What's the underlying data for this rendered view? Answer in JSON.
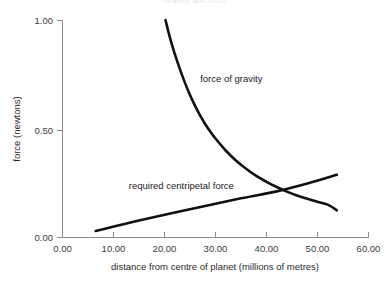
{
  "chart_data": {
    "type": "line",
    "title": "Gravity and force",
    "xlabel": "distance from centre of planet (millions of metres)",
    "ylabel": "force (newtons)",
    "xlim": [
      0,
      60
    ],
    "ylim": [
      0,
      1.0
    ],
    "xticks": [
      "0.00",
      "10.00",
      "20.00",
      "30.00",
      "40.00",
      "50.00",
      "60.00"
    ],
    "xtick_values": [
      0,
      10,
      20,
      30,
      40,
      50,
      60
    ],
    "yticks": [
      "0.00",
      "0.50",
      "1.00"
    ],
    "ytick_values": [
      0,
      0.5,
      1.0
    ],
    "grid": false,
    "legend": "inline-annotations",
    "series": [
      {
        "name": "force of gravity",
        "label_x": 27.0,
        "label_y": 0.715,
        "points": [
          [
            20.2,
            1.0
          ],
          [
            21.0,
            0.925
          ],
          [
            22.0,
            0.845
          ],
          [
            23.0,
            0.775
          ],
          [
            24.0,
            0.712
          ],
          [
            25.0,
            0.655
          ],
          [
            26.0,
            0.605
          ],
          [
            27.0,
            0.56
          ],
          [
            28.0,
            0.521
          ],
          [
            29.0,
            0.486
          ],
          [
            30.0,
            0.455
          ],
          [
            32.0,
            0.4
          ],
          [
            34.0,
            0.354
          ],
          [
            36.0,
            0.316
          ],
          [
            38.0,
            0.283
          ],
          [
            40.0,
            0.256
          ],
          [
            42.0,
            0.232
          ],
          [
            44.0,
            0.211
          ],
          [
            46.0,
            0.193
          ],
          [
            48.0,
            0.178
          ],
          [
            50.0,
            0.164
          ],
          [
            52.0,
            0.151
          ],
          [
            53.8,
            0.125
          ]
        ]
      },
      {
        "name": "required centripetal force",
        "label_x": 13.0,
        "label_y": 0.225,
        "points": [
          [
            6.5,
            0.03
          ],
          [
            15.0,
            0.078
          ],
          [
            25.0,
            0.13
          ],
          [
            35.0,
            0.18
          ],
          [
            42.0,
            0.212
          ],
          [
            48.0,
            0.248
          ],
          [
            53.8,
            0.288
          ]
        ]
      }
    ],
    "annotations": [
      {
        "text": "force of gravity",
        "x": 27.0,
        "y": 0.715
      },
      {
        "text": "required centripetal force",
        "x": 13.0,
        "y": 0.225
      }
    ],
    "intersection": {
      "x": 42.0,
      "y": 0.212
    }
  }
}
